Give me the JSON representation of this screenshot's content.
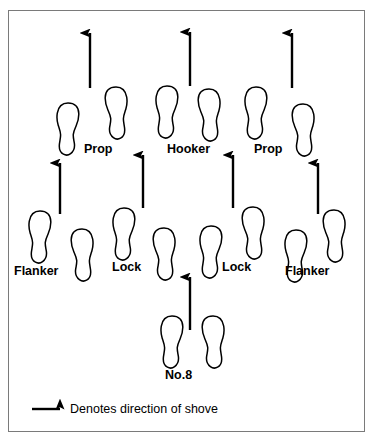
{
  "diagram": {
    "frame": {
      "x": 8,
      "y": 10,
      "width": 357,
      "height": 422,
      "border_color": "#7a7a7a"
    },
    "ink_color": "#000000",
    "background": "#ffffff",
    "positions": [
      {
        "name": "prop-left",
        "label": "Prop",
        "x": 84,
        "y": 143
      },
      {
        "name": "hooker",
        "label": "Hooker",
        "x": 167,
        "y": 143
      },
      {
        "name": "prop-right",
        "label": "Prop",
        "x": 254,
        "y": 143
      },
      {
        "name": "flanker-left",
        "label": "Flanker",
        "x": 14,
        "y": 265
      },
      {
        "name": "lock-left",
        "label": "Lock",
        "x": 112,
        "y": 261
      },
      {
        "name": "lock-right",
        "label": "Lock",
        "x": 222,
        "y": 261
      },
      {
        "name": "flanker-right",
        "label": "Flanker",
        "x": 285,
        "y": 265
      },
      {
        "name": "number-eight",
        "label": "No.8",
        "x": 165,
        "y": 369
      }
    ],
    "footprints": [
      {
        "id": "prop-left-right-foot",
        "x": 56,
        "y": 102,
        "w": 24,
        "h": 54,
        "side": "left"
      },
      {
        "id": "prop-left-left-foot",
        "x": 104,
        "y": 86,
        "w": 24,
        "h": 54,
        "side": "right"
      },
      {
        "id": "hooker-right-foot",
        "x": 155,
        "y": 85,
        "w": 24,
        "h": 54,
        "side": "left"
      },
      {
        "id": "hooker-left-foot",
        "x": 197,
        "y": 88,
        "w": 24,
        "h": 54,
        "side": "right"
      },
      {
        "id": "prop-right-right-foot",
        "x": 244,
        "y": 86,
        "w": 24,
        "h": 54,
        "side": "left"
      },
      {
        "id": "prop-right-left-foot",
        "x": 291,
        "y": 103,
        "w": 24,
        "h": 54,
        "side": "right"
      },
      {
        "id": "flanker-left-right-foot",
        "x": 28,
        "y": 210,
        "w": 24,
        "h": 54,
        "side": "left"
      },
      {
        "id": "flanker-left-left-foot",
        "x": 70,
        "y": 228,
        "w": 24,
        "h": 54,
        "side": "right"
      },
      {
        "id": "lock-left-right-foot",
        "x": 112,
        "y": 207,
        "w": 24,
        "h": 54,
        "side": "left"
      },
      {
        "id": "lock-left-left-foot",
        "x": 152,
        "y": 227,
        "w": 24,
        "h": 54,
        "side": "right"
      },
      {
        "id": "lock-right-right-foot",
        "x": 199,
        "y": 225,
        "w": 24,
        "h": 54,
        "side": "left"
      },
      {
        "id": "lock-right-left-foot",
        "x": 241,
        "y": 206,
        "w": 24,
        "h": 54,
        "side": "right"
      },
      {
        "id": "flanker-right-right-foot",
        "x": 284,
        "y": 229,
        "w": 24,
        "h": 54,
        "side": "left"
      },
      {
        "id": "flanker-right-left-foot",
        "x": 322,
        "y": 209,
        "w": 24,
        "h": 54,
        "side": "right"
      },
      {
        "id": "no8-right-foot",
        "x": 160,
        "y": 315,
        "w": 24,
        "h": 54,
        "side": "left"
      },
      {
        "id": "no8-left-foot",
        "x": 201,
        "y": 315,
        "w": 24,
        "h": 54,
        "side": "right"
      }
    ],
    "shove_arrows": [
      {
        "id": "arrow-prop-left-front",
        "x": 90,
        "y1": 88,
        "y2": 33
      },
      {
        "id": "arrow-hooker-front",
        "x": 190,
        "y1": 86,
        "y2": 32
      },
      {
        "id": "arrow-prop-right-front",
        "x": 292,
        "y1": 88,
        "y2": 33
      },
      {
        "id": "arrow-flanker-left",
        "x": 60,
        "y1": 214,
        "y2": 163
      },
      {
        "id": "arrow-lock-left",
        "x": 143,
        "y1": 208,
        "y2": 155
      },
      {
        "id": "arrow-lock-right",
        "x": 233,
        "y1": 208,
        "y2": 155
      },
      {
        "id": "arrow-flanker-right",
        "x": 318,
        "y1": 214,
        "y2": 163
      },
      {
        "id": "arrow-no8",
        "x": 190,
        "y1": 330,
        "y2": 277
      }
    ],
    "legend": {
      "arrow": {
        "x1": 32,
        "x2": 60,
        "y": 409
      },
      "text": "Denotes direction of shove",
      "text_x": 70,
      "text_y": 403
    }
  }
}
